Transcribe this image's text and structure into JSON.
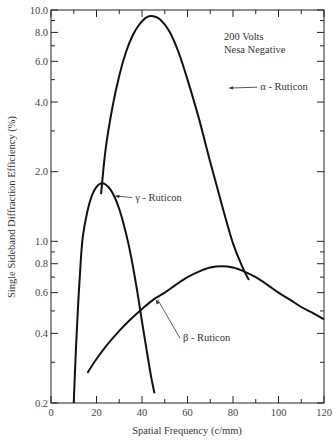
{
  "chart_data": {
    "type": "line",
    "title": "",
    "xlabel": "Spatial Frequency (c/mm)",
    "ylabel": "Single Sideband Diffraction Efficiency (%)",
    "xlim": [
      0,
      120
    ],
    "ylim": [
      0.2,
      10.0
    ],
    "yscale": "log",
    "grid": false,
    "x_ticks": [
      0,
      20,
      40,
      60,
      80,
      100,
      120
    ],
    "x_tick_labels": [
      "0",
      "20",
      "40",
      "60",
      "80",
      "100",
      "120"
    ],
    "x_minor_ticks": [
      10,
      30,
      50,
      70,
      90,
      110
    ],
    "y_ticks": [
      0.2,
      0.4,
      0.6,
      0.8,
      1.0,
      2.0,
      4.0,
      6.0,
      8.0,
      10.0
    ],
    "y_tick_labels": [
      "0.2",
      "0.4",
      "0.6",
      "0.8",
      "1.0",
      "2.0",
      "4.0",
      "6.0",
      "8.0",
      "10.0"
    ],
    "y_minor_ticks": [
      0.3,
      0.5,
      0.7,
      0.9,
      3.0,
      5.0,
      7.0,
      9.0
    ],
    "annotation_block": [
      "200 Volts",
      "Nesa Negative"
    ],
    "series": [
      {
        "name": "α - Ruticon",
        "x": [
          22,
          24,
          27,
          30,
          33,
          36,
          39,
          42,
          45,
          48,
          52,
          56,
          60,
          65,
          70,
          75,
          80,
          84,
          87
        ],
        "y": [
          1.6,
          2.5,
          3.8,
          5.2,
          6.6,
          7.8,
          8.7,
          9.3,
          9.4,
          9.1,
          8.1,
          6.6,
          5.0,
          3.4,
          2.2,
          1.45,
          0.98,
          0.78,
          0.68
        ],
        "label_pos": {
          "x": 92,
          "y": 4.5
        },
        "arrow_to": {
          "x": 78,
          "y": 4.6
        }
      },
      {
        "name": "β - Ruticon",
        "x": [
          16,
          20,
          25,
          30,
          35,
          40,
          45,
          50,
          55,
          60,
          65,
          70,
          75,
          80,
          85,
          90,
          95,
          100,
          105,
          110,
          115,
          120
        ],
        "y": [
          0.27,
          0.31,
          0.36,
          0.41,
          0.46,
          0.51,
          0.56,
          0.6,
          0.65,
          0.7,
          0.74,
          0.77,
          0.78,
          0.77,
          0.74,
          0.7,
          0.65,
          0.6,
          0.56,
          0.52,
          0.49,
          0.46
        ],
        "label_pos": {
          "x": 58,
          "y": 0.37
        },
        "arrow_to": {
          "x": 46,
          "y": 0.56
        }
      },
      {
        "name": "γ - Ruticon",
        "x": [
          10,
          11,
          12,
          13,
          14,
          16,
          18,
          20,
          22,
          24,
          26,
          28,
          30,
          32,
          34,
          36,
          38,
          40,
          42,
          44,
          45.5
        ],
        "y": [
          0.2,
          0.35,
          0.55,
          0.8,
          1.05,
          1.35,
          1.58,
          1.72,
          1.78,
          1.76,
          1.68,
          1.55,
          1.38,
          1.18,
          0.98,
          0.78,
          0.6,
          0.45,
          0.34,
          0.26,
          0.22
        ],
        "label_pos": {
          "x": 37,
          "y": 1.5
        },
        "arrow_to": {
          "x": 28,
          "y": 1.57
        }
      }
    ]
  }
}
